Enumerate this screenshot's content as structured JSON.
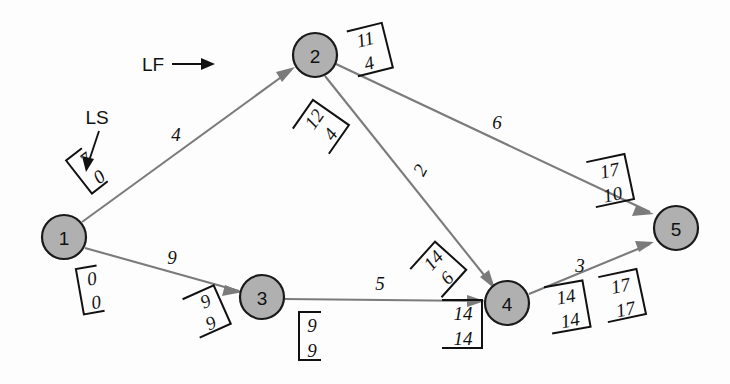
{
  "diagram": {
    "type": "activity-on-arrow-network",
    "colors": {
      "node_fill": "#b0b0b0",
      "node_stroke": "#1a1a1a",
      "edge": "#7b7b7b",
      "text": "#111111",
      "background": "#fdfdfd"
    },
    "legend": {
      "ls_label": "LS",
      "lf_label": "LF"
    },
    "nodes": [
      {
        "id": "n1",
        "label": "1",
        "cx": 64,
        "cy": 237,
        "r": 22
      },
      {
        "id": "n2",
        "label": "2",
        "cx": 315,
        "cy": 55,
        "r": 22
      },
      {
        "id": "n3",
        "label": "3",
        "cx": 262,
        "cy": 297,
        "r": 22
      },
      {
        "id": "n4",
        "label": "4",
        "cx": 507,
        "cy": 303,
        "r": 22
      },
      {
        "id": "n5",
        "label": "5",
        "cx": 676,
        "cy": 228,
        "r": 22
      }
    ],
    "edges": [
      {
        "id": "e12",
        "from": "1",
        "to": "2",
        "weight": "4",
        "lx": 176,
        "ly": 134
      },
      {
        "id": "e13",
        "from": "1",
        "to": "3",
        "weight": "9",
        "lx": 172,
        "ly": 257
      },
      {
        "id": "e25",
        "from": "2",
        "to": "5",
        "weight": "6",
        "lx": 497,
        "ly": 122
      },
      {
        "id": "e24",
        "from": "2",
        "to": "4",
        "weight": "2",
        "lx": 420,
        "ly": 170
      },
      {
        "id": "e34",
        "from": "3",
        "to": "4",
        "weight": "5",
        "lx": 380,
        "ly": 287
      },
      {
        "id": "e45",
        "from": "4",
        "to": "5",
        "weight": "3",
        "lx": 580,
        "ly": 268
      }
    ],
    "brackets": [
      {
        "id": "b1-upper",
        "near_node": "1",
        "top": "7",
        "bottom": "0",
        "x": 82,
        "y": 176,
        "rot": -38
      },
      {
        "id": "b1-lower",
        "near_node": "1",
        "top": "0",
        "bottom": "0",
        "x": 84,
        "y": 292,
        "rot": 0
      },
      {
        "id": "b2-right",
        "near_node": "2",
        "top": "11",
        "bottom": "4",
        "x": 372,
        "y": 50,
        "rot": 0
      },
      {
        "id": "b2-lower",
        "near_node": "2",
        "top": "12",
        "bottom": "4",
        "x": 322,
        "y": 127,
        "rot": -55
      },
      {
        "id": "b3-left",
        "near_node": "3",
        "top": "9",
        "bottom": "9",
        "x": 208,
        "y": 312,
        "rot": -24
      },
      {
        "id": "b3-lower",
        "near_node": "3",
        "top": "9",
        "bottom": "9",
        "x": 303,
        "y": 338,
        "rot": 0
      },
      {
        "id": "b4-upper",
        "near_node": "4",
        "top": "14",
        "bottom": "6",
        "x": 440,
        "y": 269,
        "rot": -48
      },
      {
        "id": "b4-lower",
        "near_node": "4",
        "top": "14",
        "bottom": "14",
        "x": 464,
        "y": 326,
        "rot": 0
      },
      {
        "id": "b4-right",
        "near_node": "4",
        "top": "14",
        "bottom": "14",
        "x": 570,
        "y": 308,
        "rot": 0
      },
      {
        "id": "b5-upper",
        "near_node": "5",
        "top": "17",
        "bottom": "10",
        "x": 613,
        "y": 182,
        "rot": 0
      },
      {
        "id": "b5-lower",
        "near_node": "5",
        "top": "17",
        "bottom": "17",
        "x": 625,
        "y": 297,
        "rot": 0
      }
    ],
    "annotations": [
      {
        "id": "ann-ls",
        "text": "LS",
        "tx": 97,
        "ty": 117
      },
      {
        "id": "ann-lf",
        "text": "LF",
        "tx": 153,
        "ty": 64
      }
    ]
  }
}
